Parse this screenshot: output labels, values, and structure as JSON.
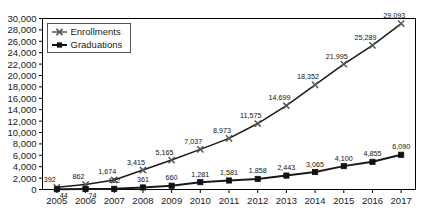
{
  "chart_data": {
    "type": "line",
    "title": "",
    "subtitle": "",
    "xlabel": "",
    "ylabel": "",
    "x": [
      2005,
      2006,
      2007,
      2008,
      2009,
      2010,
      2011,
      2012,
      2013,
      2014,
      2015,
      2016,
      2017
    ],
    "categories": [
      "2005",
      "2006",
      "2007",
      "2008",
      "2009",
      "2010",
      "2011",
      "2012",
      "2013",
      "2014",
      "2015",
      "2016",
      "2017"
    ],
    "series": [
      {
        "name": "Enrollments",
        "marker": "x-cross",
        "color": "#555555",
        "values": [
          392,
          862,
          1674,
          3415,
          5165,
          7037,
          8973,
          11575,
          14699,
          18352,
          21995,
          25289,
          29093
        ],
        "labels": [
          "392",
          "862",
          "1,674",
          "3,415",
          "5,165",
          "7,037",
          "8,973",
          "11,575",
          "14,699",
          "18,352",
          "21,995",
          "25,289",
          "29,093"
        ]
      },
      {
        "name": "Graduations",
        "marker": "square",
        "color": "#111111",
        "values": [
          44,
          74,
          122,
          361,
          660,
          1281,
          1581,
          1858,
          2443,
          3065,
          4100,
          4855,
          6090
        ],
        "labels": [
          "44",
          "74",
          "122",
          "361",
          "660",
          "1,281",
          "1,581",
          "1,858",
          "2,443",
          "3,065",
          "4,100",
          "4,855",
          "6,090"
        ]
      }
    ],
    "ylim": [
      0,
      30000
    ],
    "ytick_step": 2000,
    "yticks": [
      0,
      2000,
      4000,
      6000,
      8000,
      10000,
      12000,
      14000,
      16000,
      18000,
      20000,
      22000,
      24000,
      26000,
      28000,
      30000
    ],
    "ytick_labels": [
      "0",
      "2,000",
      "4,000",
      "6,000",
      "8,000",
      "10,000",
      "12,000",
      "14,000",
      "16,000",
      "18,000",
      "20,000",
      "22,000",
      "24,000",
      "26,000",
      "28,000",
      "30,000"
    ],
    "grid": false,
    "legend_position": "upper-left",
    "legend_entries": [
      "Enrollments",
      "Graduations"
    ]
  }
}
